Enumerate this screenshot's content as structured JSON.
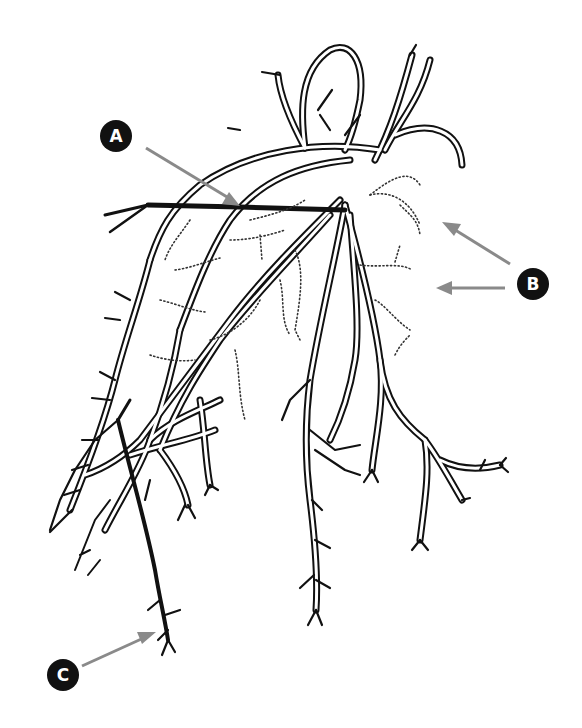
{
  "figure": {
    "background_color": "#ffffff",
    "line_color": "#111111",
    "arrow_color": "#8a8a8a",
    "callouts": [
      {
        "id": "A",
        "label": "A",
        "target": "thick horizontal lateral root near crown"
      },
      {
        "id": "B",
        "label": "B",
        "target": "dotted fine roots (two arrows)"
      },
      {
        "id": "C",
        "label": "C",
        "target": "dark thick descending root tip"
      }
    ]
  }
}
